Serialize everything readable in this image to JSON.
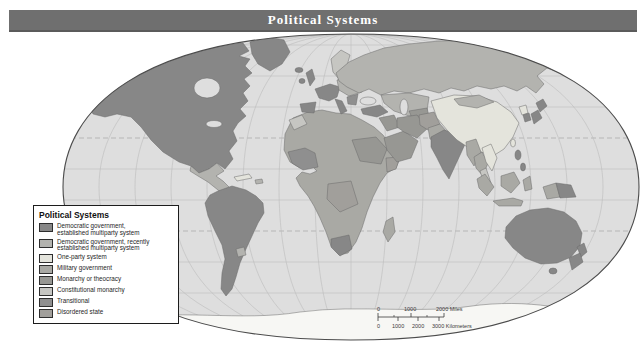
{
  "title_bar": {
    "title": "Political Systems",
    "color": "#6f6f6f"
  },
  "map": {
    "ocean_color": "#dedede",
    "outline_color": "#4c4c4c",
    "graticule_color": "#bcbcbc",
    "tropic_color": "#9c9c9c",
    "land_border_color": "#6a6a6a",
    "antarctica_color": "#f7f7f4"
  },
  "legend": {
    "title": "Political Systems",
    "items": [
      {
        "lines": [
          "Democratic government,",
          "established multiparty system"
        ],
        "color": "#878787"
      },
      {
        "lines": [
          "Democratic government, recently",
          "established multiparty system"
        ],
        "color": "#b3b3af"
      },
      {
        "lines": [
          "One-party system"
        ],
        "color": "#e4e4dc"
      },
      {
        "lines": [
          "Military government"
        ],
        "color": "#a9a9a4"
      },
      {
        "lines": [
          "Monarchy or theocracy"
        ],
        "color": "#979793"
      },
      {
        "lines": [
          "Constitutional monarchy"
        ],
        "color": "#c6c6c2"
      },
      {
        "lines": [
          "Transitional"
        ],
        "color": "#8f8f8f"
      },
      {
        "lines": [
          "Disordered state"
        ],
        "color": "#a19f9b"
      }
    ]
  },
  "scale_bar": {
    "miles": {
      "t0": "0",
      "t1": "1000",
      "t2": "2000 Miles"
    },
    "km": {
      "t0": "0",
      "t1": "1000",
      "t2": "2000",
      "t3": "3000 Kilometers"
    }
  }
}
